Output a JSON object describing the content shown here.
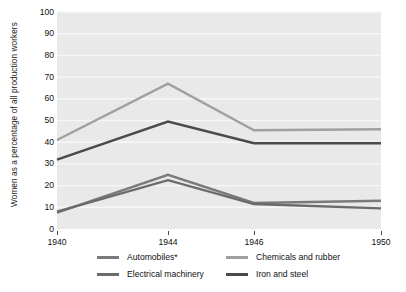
{
  "chart_data": {
    "type": "line",
    "title": "",
    "xlabel": "",
    "ylabel": "Women as a percentage of all production workers",
    "x": [
      1940,
      1944,
      1946,
      1950
    ],
    "xticklabels": [
      "1940",
      "1944",
      "1946",
      "1950"
    ],
    "ylim": [
      0,
      100
    ],
    "yticks": [
      0,
      10,
      20,
      30,
      40,
      50,
      60,
      70,
      80,
      90,
      100
    ],
    "yticklabels": [
      "0",
      "10",
      "20",
      "30",
      "40",
      "50",
      "60",
      "70",
      "80",
      "90",
      "100"
    ],
    "grid": "horizontal",
    "legend_position": "bottom",
    "series": [
      {
        "name": "Automobiles*",
        "color": "#7a7a7a",
        "values": [
          7.5,
          25.0,
          12.0,
          13.0
        ]
      },
      {
        "name": "Electrical machinery",
        "color": "#6b6b6b",
        "values": [
          8.0,
          22.5,
          11.5,
          9.5
        ]
      },
      {
        "name": "Chemicals and rubber",
        "color": "#a0a0a0",
        "values": [
          41.0,
          67.0,
          45.5,
          46.0
        ]
      },
      {
        "name": "Iron and steel",
        "color": "#4a4a4a",
        "values": [
          32.0,
          49.5,
          39.5,
          39.5
        ]
      }
    ]
  },
  "legend": {
    "items": [
      {
        "label": "Automobiles*",
        "color": "#7a7a7a"
      },
      {
        "label": "Electrical machinery",
        "color": "#6b6b6b"
      },
      {
        "label": "Chemicals and rubber",
        "color": "#a0a0a0"
      },
      {
        "label": "Iron and steel",
        "color": "#4a4a4a"
      }
    ]
  },
  "colors": {
    "plot_background": "#e9e9e9",
    "gridline": "#f7f7f7",
    "text": "#111111",
    "tick": "#4a4a4a"
  }
}
